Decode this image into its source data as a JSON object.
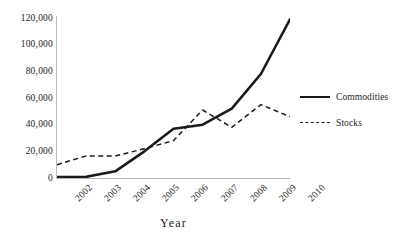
{
  "chart_data": {
    "type": "line",
    "title": "",
    "subtitle": "",
    "xlabel": "Year",
    "ylabel": "",
    "categories": [
      "2002",
      "2003",
      "2004",
      "2005",
      "2006",
      "2007",
      "2008",
      "2009",
      "2010"
    ],
    "x": [
      2002,
      2003,
      2004,
      2005,
      2006,
      2007,
      2008,
      2009,
      2010
    ],
    "series": [
      {
        "name": "Commodities",
        "style": "solid",
        "color": "#1a1a1a",
        "values": [
          800,
          900,
          5000,
          20000,
          37000,
          40000,
          52000,
          78000,
          119000
        ]
      },
      {
        "name": "Stocks",
        "style": "dashed",
        "color": "#1a1a1a",
        "values": [
          10000,
          16500,
          16500,
          22000,
          28000,
          51000,
          38000,
          55000,
          46000
        ]
      }
    ],
    "yticks": [
      0,
      20000,
      40000,
      60000,
      80000,
      100000,
      120000
    ],
    "ytick_labels": [
      "0",
      "20,000",
      "40,000",
      "60,000",
      "80,000",
      "100,000",
      "120,000"
    ],
    "ylim": [
      0,
      120000
    ],
    "xlim": [
      2002,
      2010
    ],
    "grid": false,
    "legend_position": "right",
    "axis_color": "#b9b9b9"
  },
  "legend": {
    "items": [
      {
        "label": "Commodities"
      },
      {
        "label": "Stocks"
      }
    ]
  },
  "axes": {
    "x_title": "Year"
  }
}
